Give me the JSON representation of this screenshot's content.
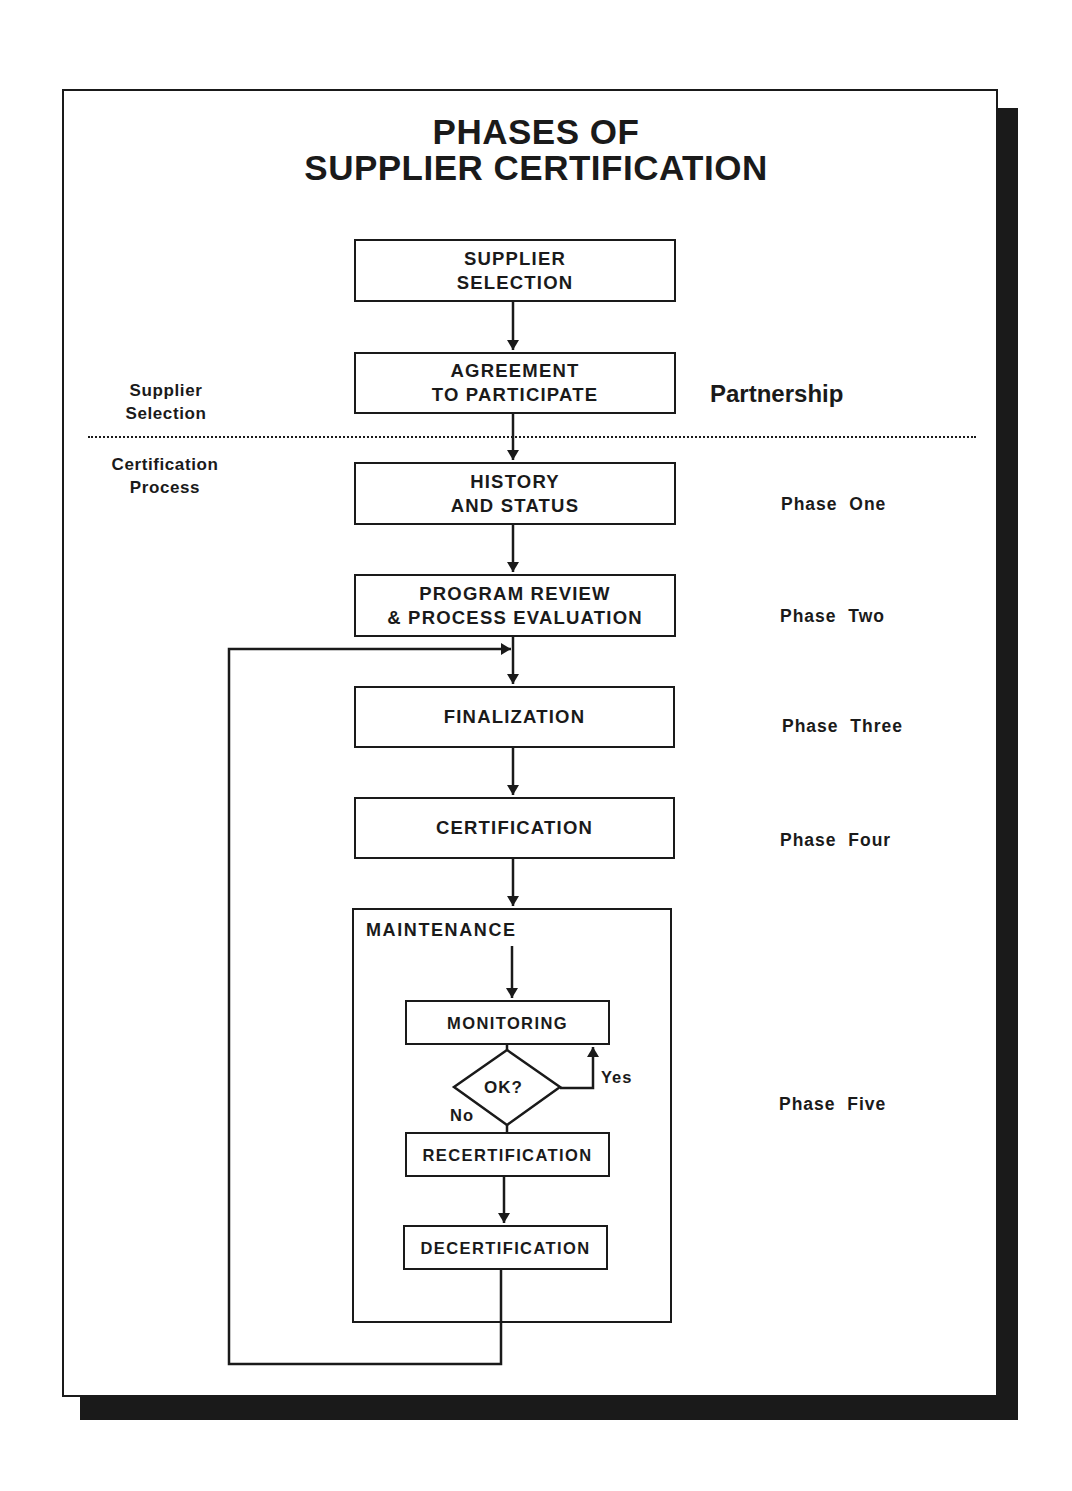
{
  "title": {
    "line1": "PHASES OF",
    "line2": "SUPPLIER  CERTIFICATION"
  },
  "sections": {
    "top": {
      "label": "Supplier\nSelection",
      "right_label": "Partnership"
    },
    "bottom": {
      "label": "Certification\nProcess"
    }
  },
  "steps": [
    {
      "id": "supplier-selection",
      "label": "SUPPLIER\nSELECTION",
      "phase": ""
    },
    {
      "id": "agreement",
      "label": "AGREEMENT\nTO  PARTICIPATE",
      "phase": ""
    },
    {
      "id": "history",
      "label": "HISTORY\nAND  STATUS",
      "phase": "Phase  One"
    },
    {
      "id": "program-review",
      "label": "PROGRAM  REVIEW\n&  PROCESS  EVALUATION",
      "phase": "Phase  Two"
    },
    {
      "id": "finalization",
      "label": "FINALIZATION",
      "phase": "Phase  Three"
    },
    {
      "id": "certification",
      "label": "CERTIFICATION",
      "phase": "Phase  Four"
    }
  ],
  "maintenance": {
    "label": "MAINTENANCE",
    "phase": "Phase  Five",
    "monitoring": "MONITORING",
    "decision": "OK?",
    "yes": "Yes",
    "no": "No",
    "recertification": "RECERTIFICATION",
    "decertification": "DECERTIFICATION"
  },
  "colors": {
    "ink": "#1a1a1a",
    "background": "#ffffff"
  }
}
